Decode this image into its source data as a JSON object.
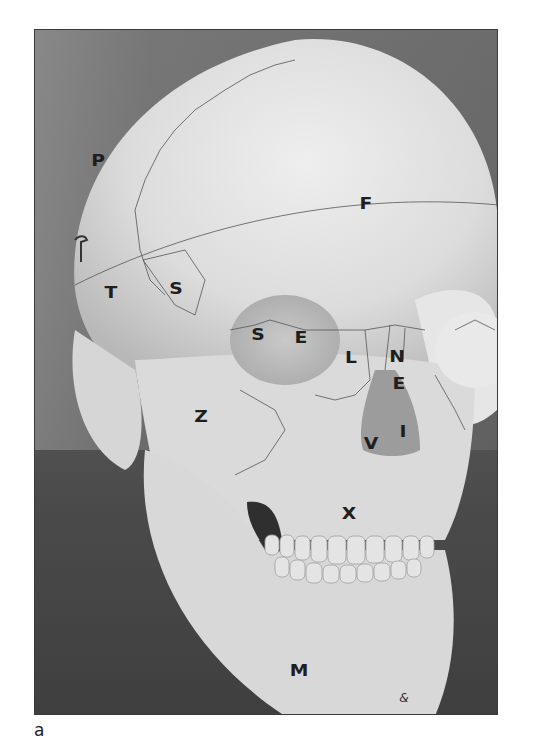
{
  "figure": {
    "labels": [
      {
        "id": "parietal",
        "text": "P",
        "x": 63,
        "y": 131
      },
      {
        "id": "frontal",
        "text": "F",
        "x": 331,
        "y": 174
      },
      {
        "id": "temporal",
        "text": "T",
        "x": 76,
        "y": 263
      },
      {
        "id": "sphenoid-greater-wing",
        "text": "S",
        "x": 141,
        "y": 259
      },
      {
        "id": "sphenoid-orbit",
        "text": "S",
        "x": 223,
        "y": 305
      },
      {
        "id": "ethmoid-orbit",
        "text": "E",
        "x": 266,
        "y": 308
      },
      {
        "id": "lacrimal",
        "text": "L",
        "x": 316,
        "y": 328
      },
      {
        "id": "nasal",
        "text": "N",
        "x": 362,
        "y": 327
      },
      {
        "id": "ethmoid-nasal",
        "text": "E",
        "x": 364,
        "y": 354
      },
      {
        "id": "zygomatic",
        "text": "Z",
        "x": 166,
        "y": 387
      },
      {
        "id": "vomer",
        "text": "V",
        "x": 336,
        "y": 414
      },
      {
        "id": "inferior-concha",
        "text": "I",
        "x": 368,
        "y": 402
      },
      {
        "id": "maxilla",
        "text": "X",
        "x": 314,
        "y": 484
      },
      {
        "id": "mandible",
        "text": "M",
        "x": 264,
        "y": 641
      }
    ],
    "signature": "&"
  },
  "caption": "a"
}
